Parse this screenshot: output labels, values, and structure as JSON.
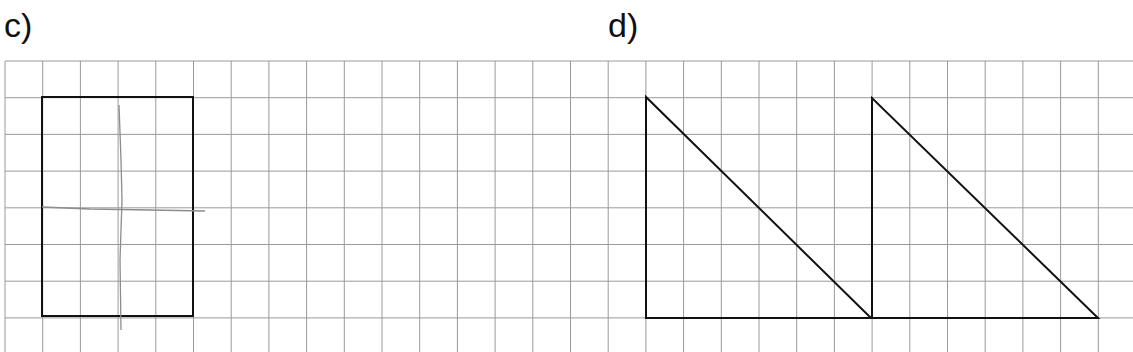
{
  "exercises": [
    {
      "label": "c)",
      "label_pos": [
        4,
        8
      ],
      "shape": "rectangle",
      "shape_points": [
        [
          42,
          97
        ],
        [
          193,
          97
        ],
        [
          193,
          316
        ],
        [
          42,
          316
        ]
      ],
      "sketch": {
        "description": "faint pencil symmetry lines (one vertical, one horizontal)",
        "vertical": [
          [
            119,
            105
          ],
          [
            121,
            160
          ],
          [
            122,
            200
          ],
          [
            120,
            260
          ],
          [
            121,
            330
          ]
        ],
        "horizontal": [
          [
            42,
            207
          ],
          [
            90,
            209
          ],
          [
            150,
            210
          ],
          [
            205,
            211
          ]
        ]
      }
    },
    {
      "label": "d)",
      "label_pos": [
        608,
        8
      ],
      "shape": "two right triangles",
      "triangles": [
        [
          [
            646,
            97
          ],
          [
            646,
            318
          ],
          [
            871,
            318
          ]
        ],
        [
          [
            872,
            98
          ],
          [
            872,
            318
          ],
          [
            1098,
            318
          ]
        ]
      ]
    }
  ],
  "grid": {
    "x0": 5,
    "y0": 61,
    "cell_w": 37.7,
    "cell_h": 36.7,
    "cols": 29,
    "rows": 8,
    "line_color": "#9a9a9a",
    "shape_color": "#111111",
    "pencil_color": "#8c8c8c"
  }
}
